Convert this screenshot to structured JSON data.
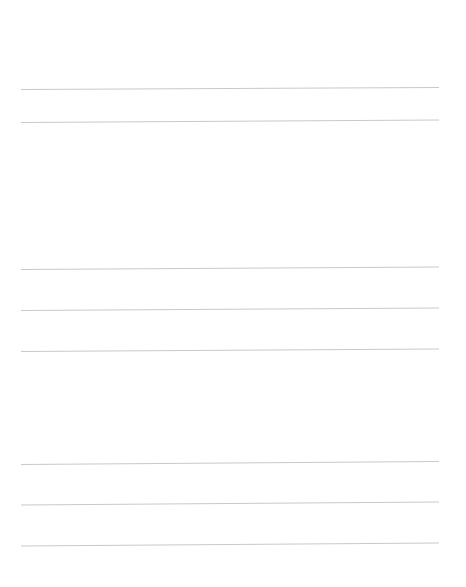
{
  "page": {
    "title": "",
    "background": "#ffffff",
    "line_color": "#c9c9c9",
    "lines": [
      {
        "x1": 21,
        "y1": 89.5,
        "x2": 439,
        "y2": 87.5
      },
      {
        "x1": 21,
        "y1": 122.5,
        "x2": 439,
        "y2": 120
      },
      {
        "x1": 21,
        "y1": 269.5,
        "x2": 439,
        "y2": 267
      },
      {
        "x1": 21,
        "y1": 310.5,
        "x2": 439,
        "y2": 308
      },
      {
        "x1": 21,
        "y1": 351.5,
        "x2": 439,
        "y2": 349
      },
      {
        "x1": 21,
        "y1": 464.5,
        "x2": 439,
        "y2": 461.5
      },
      {
        "x1": 21,
        "y1": 505,
        "x2": 439,
        "y2": 502
      },
      {
        "x1": 21,
        "y1": 546,
        "x2": 439,
        "y2": 543
      }
    ]
  }
}
